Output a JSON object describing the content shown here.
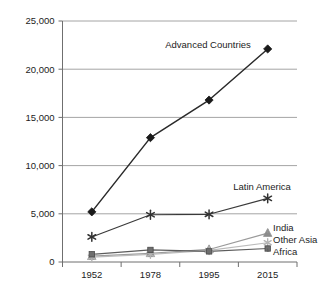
{
  "chart_data": {
    "type": "line",
    "title": "",
    "subtitle": "",
    "xlabel": "",
    "ylabel": "",
    "categories": [
      "1952",
      "1978",
      "1995",
      "2015"
    ],
    "ylim": [
      0,
      25000
    ],
    "ytick_values": [
      0,
      5000,
      10000,
      15000,
      20000,
      25000
    ],
    "ytick_labels": [
      "0",
      "5,000",
      "10,000",
      "15,000",
      "20,000",
      "25,000"
    ],
    "grid": "horizontal",
    "legend_position": "inline-annotations",
    "series": [
      {
        "name": "Advanced Countries",
        "label": "Advanced Countries",
        "values": [
          5200,
          12900,
          16800,
          22100
        ],
        "marker": "diamond",
        "color": "#1a1a1a",
        "line_color": "#2a2a2a"
      },
      {
        "name": "Latin America",
        "label": "Latin America",
        "values": [
          2600,
          4900,
          4950,
          6600
        ],
        "marker": "asterisk",
        "color": "#333333",
        "line_color": "#3a3a3a"
      },
      {
        "name": "India",
        "label": "India",
        "values": [
          600,
          900,
          1300,
          3000
        ],
        "marker": "triangle",
        "color": "#8c8c8c",
        "line_color": "#9a9a9a"
      },
      {
        "name": "Other Asia",
        "label": "Other Asia",
        "values": [
          500,
          800,
          1200,
          2000
        ],
        "marker": "star",
        "color": "#b4b4b4",
        "line_color": "#bbbbbb"
      },
      {
        "name": "Africa",
        "label": "Africa",
        "values": [
          800,
          1250,
          1100,
          1400
        ],
        "marker": "square",
        "color": "#6e6e6e",
        "line_color": "#5c5c5c"
      }
    ],
    "annotations": [
      {
        "text": "Advanced Countries",
        "series": "Advanced Countries"
      },
      {
        "text": "Latin America",
        "series": "Latin America"
      },
      {
        "text": "India",
        "series": "India"
      },
      {
        "text": "Other Asia",
        "series": "Other Asia"
      },
      {
        "text": "Africa",
        "series": "Africa"
      }
    ],
    "colors": {
      "grid": "#9a9a9a",
      "axis": "#6f6f6f",
      "background": "#ffffff",
      "text": "#1c1c1c"
    }
  }
}
